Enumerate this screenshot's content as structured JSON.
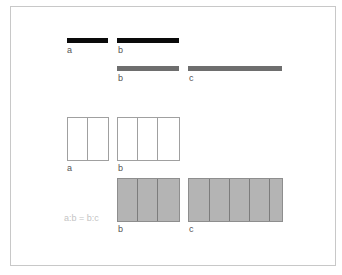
{
  "diagram": {
    "row1": {
      "bars": [
        {
          "label": "a",
          "color": "#0a0a0a",
          "length_units": 2
        },
        {
          "label": "b",
          "color": "#0a0a0a",
          "length_units": 3
        }
      ]
    },
    "row2": {
      "bars": [
        {
          "label": "b",
          "color": "#6e6e6e",
          "length_units": 3
        },
        {
          "label": "c",
          "color": "#6e6e6e",
          "length_units": 4.5
        }
      ]
    },
    "row3": {
      "boxes": [
        {
          "label": "a",
          "cells": 2,
          "style": "outline"
        },
        {
          "label": "b",
          "cells": 3,
          "style": "outline"
        }
      ]
    },
    "row4": {
      "boxes": [
        {
          "label": "b",
          "cells": 3,
          "style": "filled",
          "fill": "#b4b4b4"
        },
        {
          "label": "c",
          "cells": 4.5,
          "style": "filled",
          "fill": "#b4b4b4"
        }
      ]
    },
    "ratio_text": "a:b = b:c"
  }
}
